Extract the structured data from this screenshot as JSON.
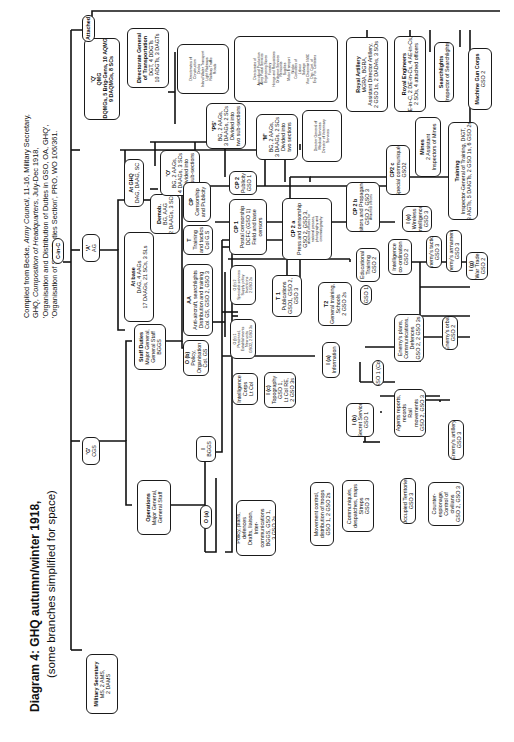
{
  "title": "Diagram 4: GHQ autumn/winter 1918,",
  "subtitle": "(some branches simplified for space)",
  "source": {
    "line1_a": "Compiled from Becke, ",
    "line1_b": "Army Council",
    "line1_c": ", 11-16, Military Secretary,",
    "line2_a": "GHQ, ",
    "line2_b": "Composition of Headquarters",
    "line2_c": ", July-Dec 1918,",
    "line3": "'Organisation and Distribution of Duties in GSO, OA, GHQ',",
    "line4": "'Organisation of Staff Duties Section', PRO, WO 106/361."
  },
  "nodes": {
    "cinc": {
      "title": "C-in-C"
    },
    "military_secretary": {
      "title": "Military Secretary",
      "lines": [
        "MS, 2 AMS,",
        "2 DAMS"
      ]
    },
    "g_cgs": {
      "title": "'G'",
      "lines": [
        "CGS"
      ]
    },
    "a_ag": {
      "title": "'A'",
      "lines": [
        "AG"
      ]
    },
    "q_qmg": {
      "title": "'Q'",
      "lines": [
        "QMG",
        "2 DQMGs, 5 Brig-Gens, 10 AQMGs",
        "9 DAQMGs, 8 SCs"
      ]
    },
    "attached": {
      "title": "Attached"
    },
    "operations": {
      "title": "Operations",
      "lines": [
        "Major General,",
        "General Staff"
      ]
    },
    "staff_duties": {
      "title": "Staff Duties",
      "lines": [
        "Major General,",
        "General Staff",
        "BGGS"
      ]
    },
    "at_base": {
      "title": "At base",
      "lines": [
        "DAG, 4 AAGs",
        "17 DAAGs, 21 SCs, 3 SLs"
      ]
    },
    "at_ghq": {
      "title": "At GHQ",
      "lines": [
        "DAG, DAAG, SC"
      ]
    },
    "demob": {
      "title": "Demob.",
      "lines": [
        "BG, AAG",
        "2 DAAGs, 3 SCs"
      ]
    },
    "ag_o": {
      "title": "'O'",
      "lines": [
        "BG, 2 AAGs,",
        "4 DAAGs, 3 SCs",
        "Divided into",
        "two sub-sections"
      ]
    },
    "ag_ps": {
      "title": "'PS'",
      "lines": [
        "BG, 2 AAGs,",
        "3 DAAGs, 2 SCs",
        "Divided into",
        "two sub-sections"
      ]
    },
    "ag_m": {
      "title": "'M'",
      "lines": [
        "BG, 2 AAGs,",
        "3 DAAGs, 2 SCs",
        "Divided into",
        "two sections"
      ]
    },
    "dg_medical": {
      "lines": [
        "Director General of",
        "Medical Services",
        "Director of Veterinary",
        "Services"
      ]
    },
    "dg_transportation": {
      "title": "Directorate General",
      "lines": [
        "of Transportation",
        "DGT, 4 DDGTs",
        "10 ADGTs, 3 DAGTs"
      ]
    },
    "dir_construction": {
      "lines": [
        "Directorates of",
        "Construction",
        "Docks",
        "Inland Water Transport",
        "Light Railways",
        "Railway Traffic",
        "Roads"
      ]
    },
    "dir_agricultural": {
      "lines": [
        "Directorates of",
        "Agricultural Production",
        "Army Postal Services",
        "Engineering Stores",
        "Forestry",
        "Hirings and Requisitions",
        "Ordnance Services",
        "Remounts",
        "Supplies",
        "Motor Transport",
        "Works",
        "Controllers of",
        "Labour",
        "Salvage",
        "Vice Chairman NWC",
        "Dep. Cont. of",
        "Exp. For. Canteens"
      ]
    },
    "royal_artillery": {
      "title": "Royal Artillery",
      "lines": [
        "MGRA, BGRA,",
        "Assistant Director Artillery,",
        "2 GSO 1s, 2 DADAs, 3 SOs"
      ]
    },
    "royal_engineers": {
      "title": "Royal Engineers",
      "lines": [
        "E-in-C, 2 DE-in-Cs, 4 AE-in-Cs,",
        "2 SOs, 4 attached officers"
      ]
    },
    "searchlights": {
      "title": "Searchlights",
      "lines": [
        "Inspector of Searchlights"
      ]
    },
    "machine_gun_corps": {
      "title": "Machine Gun Corps",
      "lines": [
        "GSO 2"
      ]
    },
    "mines": {
      "title": "Mines",
      "lines": [
        "2 Assistant",
        "Inspectors of Mines"
      ]
    },
    "training": {
      "title": "Training",
      "lines": [
        "Inspector-General of Training, DIGT,",
        "3 AIGTs, 5 DAIGTs, 2 GSO 1s, 6 GSO 2s"
      ]
    },
    "i_bggs": {
      "title": "I",
      "lines": [
        "BGGS"
      ]
    },
    "o_a": {
      "title": "O (a)"
    },
    "o_b": {
      "title": "O (b)",
      "lines": [
        "Policy,",
        "Organisation",
        "Col. GS"
      ]
    },
    "aa": {
      "title": "AA",
      "lines": [
        "Anti-aircraft, searchlights",
        "Distribution and training",
        "Col. GS, GSO 2, GSO 3"
      ]
    },
    "t_training": {
      "title": "T",
      "lines": [
        "Training",
        "and tactics",
        "Col G.S"
      ]
    },
    "cp": {
      "title": "CP",
      "lines": [
        "Censorship",
        "and Publicity"
      ]
    },
    "ob1": {
      "lines": [
        "O (b) 1",
        "Personnel,",
        "Establishments",
        "New units",
        "GSO2, 2 GSO 3s"
      ]
    },
    "ob2": {
      "lines": [
        "O (b) 2",
        "Specialist services",
        "Supply policy",
        "Inventions",
        "2 GSO 2s"
      ]
    },
    "t1": {
      "title": "T 1",
      "lines": [
        "Publications",
        "GSO1, GSO 2,",
        "GSO 3"
      ]
    },
    "t2": {
      "title": "T2",
      "lines": [
        "General training,",
        "Schools",
        "2 GSO 2s"
      ]
    },
    "educational_training": {
      "lines": [
        "Educational",
        "Training",
        "GSO 2"
      ]
    },
    "cp1": {
      "title": "CP 1",
      "lines": [
        "Postal censorship",
        "DCFC (GSO 1)",
        "Field and base",
        "censors"
      ]
    },
    "cp2": {
      "title": "CP 2",
      "lines": [
        "Publicity",
        "GSO 1"
      ]
    },
    "cp2a": {
      "title": "CP 2 a",
      "lines": [
        "Press and censorship",
        "GSO 2, GSO 3,"
      ],
      "small": [
        "attached officers for",
        "national presses,",
        "photography and",
        "cinematography"
      ]
    },
    "cp2b": {
      "title": "CP 2 b",
      "lines": [
        "Visitors and Propaganda",
        "GSO 2, GSO 3"
      ],
      "small": [
        "Attached officers"
      ]
    },
    "cp2c": {
      "title": "CP2 c",
      "lines": [
        "Special communiqués",
        "GSO2"
      ]
    },
    "intelligence_corps": {
      "lines": [
        "Intelligence",
        "Corps",
        "Lt Col"
      ]
    },
    "i_c": {
      "title": "I (c)",
      "lines": [
        "Topography",
        "GSO 1,",
        "Lt Col RE,",
        "2 GSO 3s"
      ]
    },
    "i_a": {
      "title": "I (a)",
      "lines": [
        "Information"
      ]
    },
    "gso1_col": {
      "lines": [
        "GSO 1 (Col)"
      ]
    },
    "gso1": {
      "lines": [
        "GSO 1"
      ]
    },
    "intel_coord": {
      "lines": [
        "Intelligence",
        "co-ordination",
        "GSO 2"
      ]
    },
    "i_e": {
      "title": "I (e)",
      "lines": [
        "Wireless",
        "intelligence",
        "GSO 3"
      ]
    },
    "enemy_tactics": {
      "lines": [
        "Enemy's tactics",
        "GSO 3"
      ]
    },
    "enemy_armaments": {
      "lines": [
        "Enemy's armaments",
        "GSO 3"
      ]
    },
    "i_g": {
      "title": "I (g)",
      "lines": [
        "War Trade",
        "GSO 2"
      ]
    },
    "enemy_plans": {
      "lines": [
        "Enemy's plans,",
        "Communications,",
        "Defences",
        "GSO 2, 2 GSO 3s"
      ]
    },
    "enemy_orbat": {
      "lines": [
        "Enemy's orbat",
        "GSO 2"
      ]
    },
    "agents_reports": {
      "lines": [
        "Agents reports,",
        "records",
        "Rail",
        "movements",
        "GSO 2, GSO 3"
      ]
    },
    "enemy_artillery": {
      "lines": [
        "Enemy's artillery",
        "GSO 3"
      ]
    },
    "i_b": {
      "title": "I (b)",
      "lines": [
        "Secret Service",
        "GSO 1"
      ]
    },
    "occupied_territories": {
      "lines": [
        "Occupied Territories",
        "GSO 3"
      ]
    },
    "counter_espionage": {
      "lines": [
        "Counter-",
        "espionage,",
        "Control of",
        "civilians",
        "GSO 2, GSO 3"
      ]
    },
    "policy_plans": {
      "lines": [
        "Policy, plans,",
        "defences",
        "Drafts, liaison,",
        "Inter-",
        "communications",
        "BGGS, GSO 1,",
        "3 GSO 2s"
      ]
    },
    "movement_control": {
      "lines": [
        "Movement control,",
        "distribution of troops",
        "GSO 1, 2 GSO 2s"
      ]
    },
    "communiques": {
      "lines": [
        "Communiqués,",
        "despatches,  maps",
        "Sitreps",
        "GSO 3"
      ]
    }
  }
}
